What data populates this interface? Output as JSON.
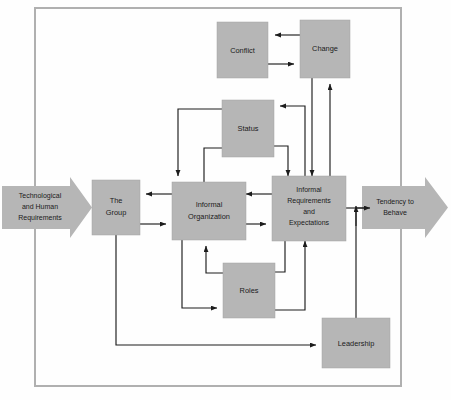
{
  "figure": {
    "type": "flow-diagram",
    "title": "",
    "frame": {
      "color": "#b0b0b0"
    },
    "palette": {
      "box_fill": "#b6b6b6",
      "box_stroke": "#a3a3a3",
      "line": "#1c1c1c",
      "text": "#1b1b1b",
      "background": "#fefefe"
    }
  },
  "input_arrow": {
    "name": "technological-and-human-requirements",
    "lines": [
      "Technological",
      "and Human",
      "Requirements"
    ]
  },
  "output_arrow": {
    "name": "tendency-to-behave",
    "lines": [
      "Tendency to",
      "Behave"
    ]
  },
  "nodes": [
    {
      "id": "conflict",
      "lines": [
        "Conflict"
      ]
    },
    {
      "id": "change",
      "lines": [
        "Change"
      ]
    },
    {
      "id": "status",
      "lines": [
        "Status"
      ]
    },
    {
      "id": "group",
      "lines": [
        "The",
        "Group"
      ]
    },
    {
      "id": "informal_organization",
      "lines": [
        "Informal",
        "Organization"
      ]
    },
    {
      "id": "informal_requirements",
      "lines": [
        "Informal",
        "Requirements",
        "and",
        "Expectations"
      ]
    },
    {
      "id": "roles",
      "lines": [
        "Roles"
      ]
    },
    {
      "id": "leadership",
      "lines": [
        "Leadership"
      ]
    }
  ],
  "edges": [
    {
      "from": "change",
      "to": "conflict"
    },
    {
      "from": "conflict",
      "to": "change"
    },
    {
      "from": "change",
      "to": "informal_requirements"
    },
    {
      "from": "informal_requirements",
      "to": "change"
    },
    {
      "from": "technological_and_human_requirements",
      "to": "group"
    },
    {
      "from": "informal_organization",
      "to": "group"
    },
    {
      "from": "group",
      "to": "informal_organization"
    },
    {
      "from": "informal_organization",
      "to": "informal_requirements"
    },
    {
      "from": "informal_requirements",
      "to": "informal_organization"
    },
    {
      "from": "informal_organization",
      "to": "status"
    },
    {
      "from": "status",
      "to": "informal_organization"
    },
    {
      "from": "status",
      "to": "informal_requirements"
    },
    {
      "from": "informal_requirements",
      "to": "status"
    },
    {
      "from": "informal_organization",
      "to": "roles"
    },
    {
      "from": "roles",
      "to": "informal_organization"
    },
    {
      "from": "roles",
      "to": "informal_requirements"
    },
    {
      "from": "informal_requirements",
      "to": "roles"
    },
    {
      "from": "group",
      "to": "leadership"
    },
    {
      "from": "leadership",
      "to": "tendency_to_behave"
    },
    {
      "from": "informal_requirements",
      "to": "tendency_to_behave"
    }
  ]
}
